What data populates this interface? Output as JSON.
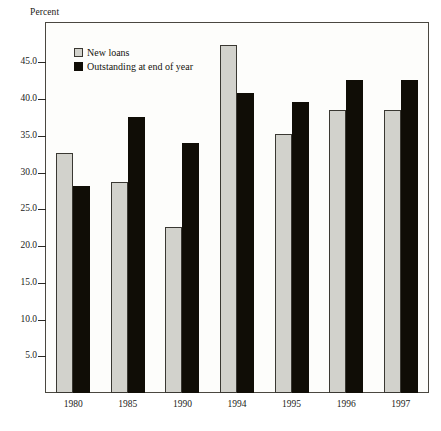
{
  "chart_data": {
    "type": "bar",
    "title": "",
    "subtitle": "",
    "xlabel": "",
    "ylabel": "Percent",
    "ylim": [
      0,
      50
    ],
    "yticks": [
      "5.0",
      "10.0",
      "15.0",
      "20.0",
      "25.0",
      "30.0",
      "35.0",
      "40.0",
      "45.0"
    ],
    "ytick_values": [
      5,
      10,
      15,
      20,
      25,
      30,
      35,
      40,
      45
    ],
    "grid": false,
    "legend_position": "top-left-inside",
    "categories": [
      "1980",
      "1985",
      "1990",
      "1994",
      "1995",
      "1996",
      "1997"
    ],
    "series": [
      {
        "name": "New loans",
        "color": "#d2d2cc",
        "values": [
          32.6,
          28.7,
          22.6,
          47.3,
          35.2,
          38.5,
          38.5
        ]
      },
      {
        "name": "Outstanding at end of year",
        "color": "#100d06",
        "values": [
          28.1,
          37.5,
          34.0,
          40.8,
          39.6,
          42.6,
          42.6
        ]
      }
    ]
  },
  "axis": {
    "y_title": "Percent"
  }
}
